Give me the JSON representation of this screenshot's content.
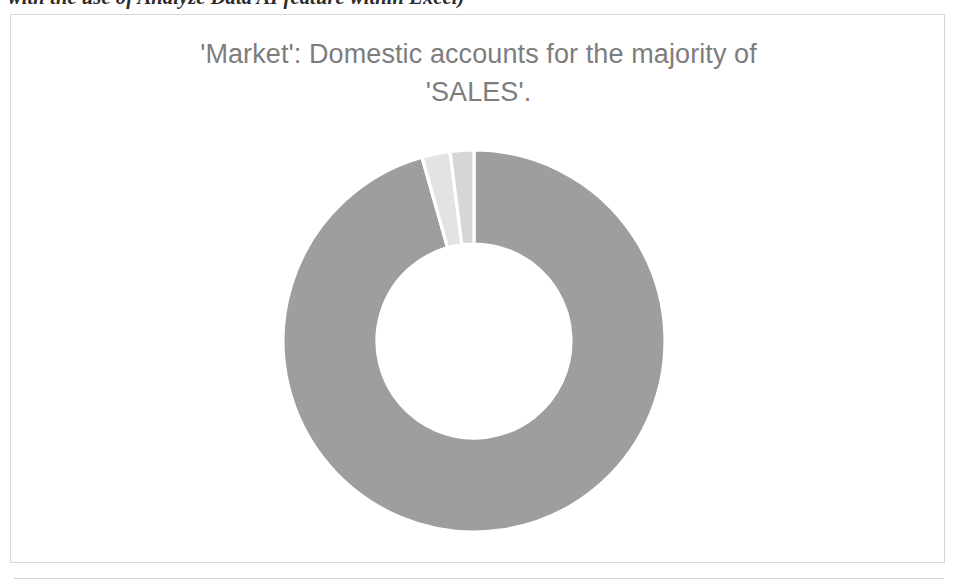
{
  "document": {
    "caption_above": "with the use of Analyze Data AI feature within Excel)"
  },
  "chart": {
    "title_line1": "'Market': Domestic accounts for the majority of",
    "title_line2": "'SALES'.",
    "title_full": "'Market': Domestic accounts for the majority of\n'SALES'.",
    "title_color": "#7d7d7d",
    "frame_border_color": "#d7d7d7",
    "background_color": "#ffffff"
  },
  "chart_data": {
    "type": "pie",
    "variant": "doughnut",
    "title": "'Market': Domestic accounts for the majority of 'SALES'.",
    "measure": "SALES",
    "dimension": "Market",
    "legend": "none",
    "grid": false,
    "start_angle_deg": 0,
    "direction": "clockwise",
    "inner_radius_ratio": 0.51,
    "labels": [
      "Domestic",
      "Other 1",
      "Other 2"
    ],
    "values": [
      95.6,
      2.4,
      2.0
    ],
    "units": "percent",
    "colors": [
      "#9e9e9e",
      "#e3e3e3",
      "#d6d6d6"
    ],
    "slices": [
      {
        "label": "Domestic",
        "value": 95.6,
        "color": "#9e9e9e",
        "start_deg": 0.0,
        "end_deg": 344.2
      },
      {
        "label": "Other 1",
        "value": 2.4,
        "color": "#e3e3e3",
        "start_deg": 344.2,
        "end_deg": 352.8
      },
      {
        "label": "Other 2",
        "value": 2.0,
        "color": "#d6d6d6",
        "start_deg": 352.8,
        "end_deg": 360.0
      }
    ],
    "geometry": {
      "center_x": 463,
      "center_y": 326,
      "outer_radius": 191,
      "inner_radius": 97
    }
  }
}
